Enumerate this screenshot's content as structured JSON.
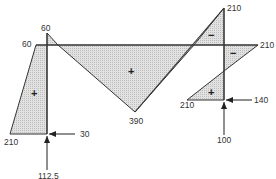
{
  "diagram": {
    "type": "bending-moment-diagram",
    "labels": {
      "left_top": "60",
      "apex_top": "60",
      "left_bottom": "210",
      "middle_bottom": "390",
      "right_top": "210",
      "right_middle": "210",
      "right_lower": "210"
    },
    "signs": {
      "left_region": "+",
      "middle_region": "+",
      "right_upper_region": "−",
      "right_middle_region": "−",
      "right_lower_region": "+"
    },
    "forces": {
      "left_horizontal": "30",
      "left_vertical": "112.5",
      "right_horizontal": "140",
      "right_vertical": "100"
    },
    "colors": {
      "line": "#333333",
      "fill": "#d6d6d6",
      "background": "#ffffff"
    }
  }
}
